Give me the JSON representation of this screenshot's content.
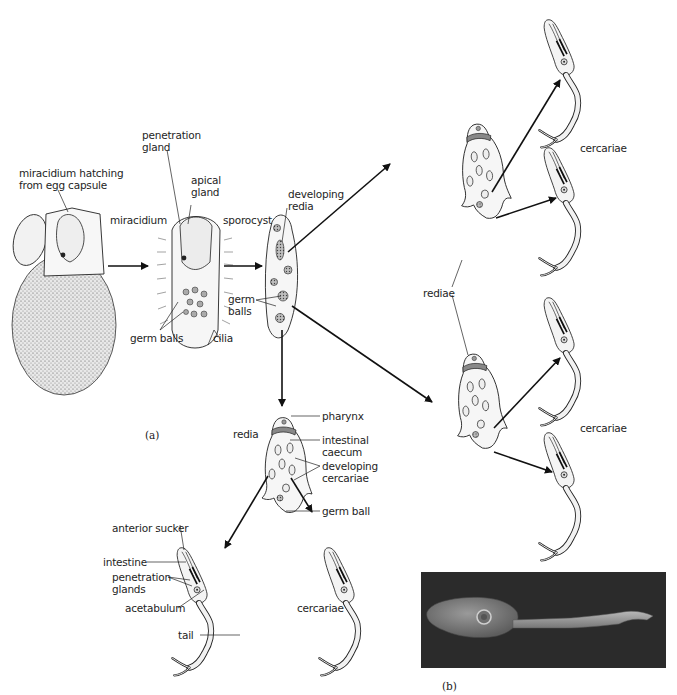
{
  "figure": {
    "panels": [
      {
        "id": "a",
        "label": "(a)"
      },
      {
        "id": "b",
        "label": "(b)"
      }
    ],
    "stages": {
      "egg": {
        "label": "miracidium hatching\nfrom egg capsule"
      },
      "miracidium": {
        "label": "miracidium",
        "parts": {
          "penetration_gland": "penetration\ngland",
          "apical_gland": "apical\ngland",
          "germ_balls": "germ balls",
          "cilia": "cilia"
        }
      },
      "sporocyst": {
        "label": "sporocyst",
        "parts": {
          "developing_redia": "developing\nredia",
          "germ_balls": "germ\nballs"
        }
      },
      "redia": {
        "label": "redia",
        "parts": {
          "pharynx": "pharynx",
          "intestinal_caecum": "intestinal\ncaecum",
          "developing_cercariae": "developing\ncercariae",
          "germ_ball": "germ ball"
        }
      },
      "cercaria_detail": {
        "parts": {
          "anterior_sucker": "anterior sucker",
          "intestine": "intestine",
          "penetration_glands": "penetration\nglands",
          "acetabulum": "acetabulum",
          "tail": "tail"
        }
      },
      "cercariae_bottom": {
        "label": "cercariae"
      },
      "rediae": {
        "label": "rediae"
      },
      "cercariae_top": {
        "label": "cercariae"
      },
      "cercariae_mid": {
        "label": "cercariae"
      }
    },
    "photo": {
      "description": "scanning electron micrograph of a cercaria",
      "background": "#2b2b2b"
    },
    "colors": {
      "ink": "#1a1a1a",
      "background": "#ffffff"
    }
  }
}
